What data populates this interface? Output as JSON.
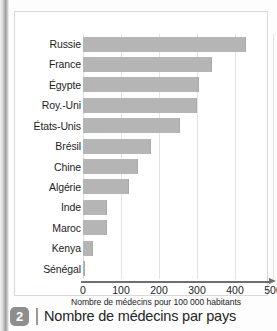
{
  "chart_data": {
    "type": "bar",
    "orientation": "horizontal",
    "title": "Nombre de médecins par pays",
    "xlabel": "Nombre de médecins pour 100 000 habitants",
    "ylabel": "",
    "xlim": [
      0,
      500
    ],
    "xticks": [
      0,
      100,
      200,
      300,
      400,
      500
    ],
    "grid": true,
    "legend": null,
    "categories": [
      "Russie",
      "France",
      "Égypte",
      "Roy.-Uni",
      "États-Unis",
      "Brésil",
      "Chine",
      "Algérie",
      "Inde",
      "Maroc",
      "Kenya",
      "Sénégal"
    ],
    "values": [
      430,
      340,
      305,
      300,
      255,
      180,
      145,
      120,
      63,
      63,
      27,
      6
    ],
    "bar_color": "#b5b5b5",
    "grid_color": "#e3e3e3",
    "axis_color": "#6f6f6f"
  },
  "figure": {
    "caption_number": "2",
    "caption_title": "Nombre de médecins par pays"
  }
}
